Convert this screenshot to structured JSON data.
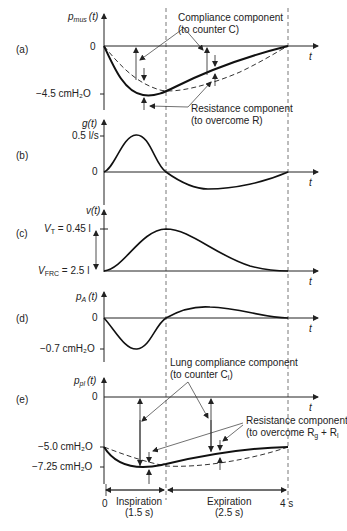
{
  "figure": {
    "time_axis": {
      "label": "t",
      "origin_label": "0",
      "end_label": "4 s",
      "phases": [
        {
          "name": "Inspiration",
          "duration": "(1.5 s)"
        },
        {
          "name": "Expiration",
          "duration": "(2.5 s)"
        }
      ]
    },
    "panels": [
      {
        "id": "(a)",
        "ylabel_main": "p",
        "ylabel_sub": "mus",
        "ylabel_arg": "(t)",
        "ticks": [
          "0",
          "−4.5 cmH₂O"
        ],
        "annotations": [
          {
            "line1": "Compliance component",
            "line2": "(to counter C)"
          },
          {
            "line1": "Resistance component",
            "line2": "(to overcome R)"
          }
        ]
      },
      {
        "id": "(b)",
        "ylabel_main": "g",
        "ylabel_arg": "(t)",
        "ticks": [
          "0.5 l/s",
          "0"
        ]
      },
      {
        "id": "(c)",
        "ylabel_main": "v",
        "ylabel_arg": "(t)",
        "ticks": [
          "V",
          "T",
          " = 0.45 l",
          "V",
          "FRC",
          " = 2.5 l"
        ]
      },
      {
        "id": "(d)",
        "ylabel_main": "p",
        "ylabel_sub": "A",
        "ylabel_arg": "(t)",
        "ticks": [
          "0",
          "−0.7 cmH₂O"
        ]
      },
      {
        "id": "(e)",
        "ylabel_main": "p",
        "ylabel_sub": "pl",
        "ylabel_arg": "(t)",
        "ticks": [
          "0",
          "−5.0 cmH₂O",
          "−7.25 cmH₂O"
        ],
        "annotations": [
          {
            "line1": "Lung compliance component",
            "line2": "(to counter C",
            "line2_sub": "l",
            "line2_end": ")"
          },
          {
            "line1": "Resistance component",
            "line2": "(to overcome R",
            "line2_sub1": "g",
            "line2_mid": " + R",
            "line2_sub2": "l"
          }
        ]
      }
    ]
  }
}
